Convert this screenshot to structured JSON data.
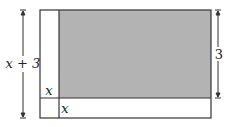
{
  "diagram": {
    "left_dimension_label": "x + 3",
    "right_dimension_label": "3",
    "inner_corner_label": "x",
    "bottom_strip_label": "x",
    "colors": {
      "shaded_fill": "#b3b3b3",
      "line": "#333333",
      "background": "#ffffff"
    }
  }
}
